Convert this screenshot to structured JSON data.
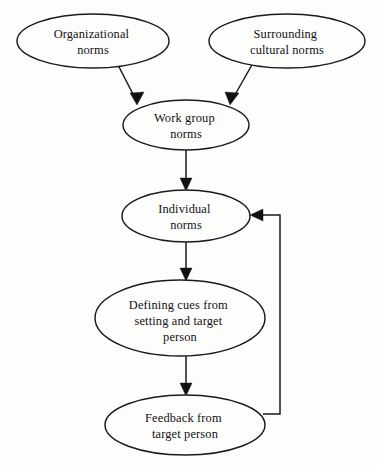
{
  "diagram": {
    "background_color": "#fdfdfc",
    "line_color": "#1a1a1a",
    "text_color": "#111111",
    "nodes": [
      {
        "id": "organizational-norms",
        "label_lines": [
          "Organizational",
          "norms"
        ],
        "line1": "Organizational",
        "line2": "norms",
        "shape": "ellipse",
        "cx": 93,
        "cy": 41,
        "rx": 76,
        "ry": 27
      },
      {
        "id": "surrounding-cultural-norms",
        "label_lines": [
          "Surrounding",
          "cultural norms"
        ],
        "line1": "Surrounding",
        "line2": "cultural norms",
        "shape": "ellipse",
        "cx": 287,
        "cy": 41,
        "rx": 78,
        "ry": 27
      },
      {
        "id": "work-group-norms",
        "label_lines": [
          "Work group",
          "norms"
        ],
        "line1": "Work group",
        "line2": "norms",
        "shape": "ellipse",
        "cx": 186,
        "cy": 125,
        "rx": 63,
        "ry": 25
      },
      {
        "id": "individual-norms",
        "label_lines": [
          "Individual",
          "norms"
        ],
        "line1": "Individual",
        "line2": "norms",
        "shape": "ellipse",
        "cx": 186,
        "cy": 216,
        "rx": 64,
        "ry": 26
      },
      {
        "id": "defining-cues",
        "label_lines": [
          "Defining cues from",
          "setting and target",
          "person"
        ],
        "line1": "Defining cues from",
        "line2": "setting and target",
        "line3": "person",
        "shape": "ellipse",
        "cx": 180,
        "cy": 318,
        "rx": 85,
        "ry": 38
      },
      {
        "id": "feedback-from-target-person",
        "label_lines": [
          "Feedback from",
          "target person"
        ],
        "line1": "Feedback from",
        "line2": "target person",
        "shape": "ellipse",
        "cx": 185,
        "cy": 425,
        "rx": 80,
        "ry": 30
      }
    ],
    "edges": [
      {
        "id": "edge-organizational-to-workgroup",
        "from": "organizational-norms",
        "to": "work-group-norms",
        "type": "diagonal-arrow"
      },
      {
        "id": "edge-surrounding-to-workgroup",
        "from": "surrounding-cultural-norms",
        "to": "work-group-norms",
        "type": "diagonal-arrow"
      },
      {
        "id": "edge-workgroup-to-individual",
        "from": "work-group-norms",
        "to": "individual-norms",
        "type": "vertical-arrow"
      },
      {
        "id": "edge-individual-to-definingcues",
        "from": "individual-norms",
        "to": "defining-cues",
        "type": "vertical-arrow"
      },
      {
        "id": "edge-definingcues-to-feedback",
        "from": "defining-cues",
        "to": "feedback-from-target-person",
        "type": "vertical-arrow"
      },
      {
        "id": "edge-feedback-to-individual",
        "from": "feedback-from-target-person",
        "to": "individual-norms",
        "type": "feedback-loop-arrow"
      }
    ]
  }
}
